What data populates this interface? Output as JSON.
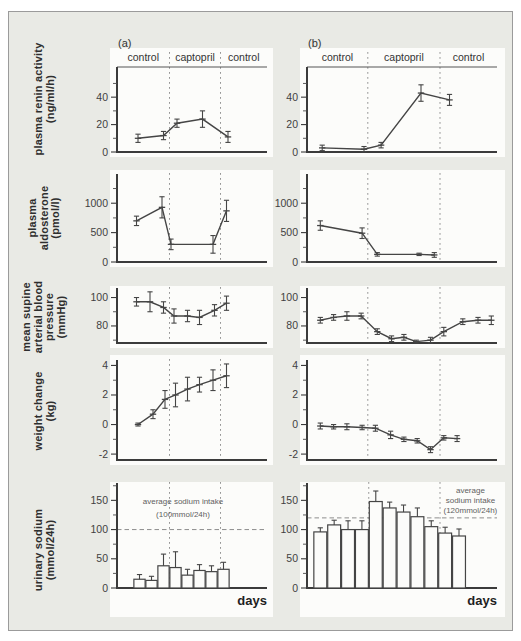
{
  "figure": {
    "period_labels": [
      "control",
      "captopril",
      "control"
    ],
    "x_axis_label": "days",
    "panel_letters": {
      "a": "(a)",
      "b": "(b)"
    },
    "colors": {
      "frame_bg": "#e9eae5",
      "plot_bg": "#fcfcfa",
      "line": "#454545",
      "dashed": "#969696",
      "text": "#333333"
    }
  },
  "rows": [
    {
      "label_lines": [
        "plasma renin activity",
        "(ng/ml/h)"
      ]
    },
    {
      "label_lines": [
        "plasma",
        "aldosterone",
        "(pmol/l)"
      ]
    },
    {
      "label_lines": [
        "mean supine",
        "arterial blood",
        "pressure",
        "(mmHg)"
      ]
    },
    {
      "label_lines": [
        "weight change",
        "(kg)"
      ]
    },
    {
      "label_lines": [
        "urinary sodium",
        "(mmol/24h)"
      ]
    }
  ],
  "chart_data": [
    {
      "id": "plasma-renin-a",
      "row": 0,
      "col": "a",
      "type": "line",
      "title": "plasma renin activity (ng/ml/h), panel (a)",
      "ylim": [
        0,
        62
      ],
      "yticks": [
        0,
        20,
        40
      ],
      "yminor": [
        10,
        30,
        50
      ],
      "dividers": [
        0.35,
        0.69
      ],
      "header": true,
      "panel_letter": "(a)",
      "x": [
        0.14,
        0.31,
        0.4,
        0.57,
        0.74
      ],
      "values": [
        10,
        12,
        21,
        24,
        11
      ],
      "errors": [
        3,
        3,
        3,
        6,
        4
      ]
    },
    {
      "id": "plasma-renin-b",
      "row": 0,
      "col": "b",
      "type": "line",
      "title": "plasma renin activity (ng/ml/h), panel (b)",
      "ylim": [
        0,
        62
      ],
      "yticks": [
        0,
        20,
        40
      ],
      "yminor": [
        10,
        30,
        50
      ],
      "dividers": [
        0.32,
        0.7
      ],
      "header": true,
      "panel_letter": "(b)",
      "x": [
        0.08,
        0.3,
        0.39,
        0.6,
        0.75
      ],
      "values": [
        3,
        2,
        5,
        43,
        38
      ],
      "errors": [
        2,
        2,
        2,
        6,
        4
      ]
    },
    {
      "id": "plasma-aldosterone-a",
      "row": 1,
      "col": "a",
      "type": "line",
      "title": "plasma aldosterone (pmol/l), panel (a)",
      "ylim": [
        0,
        1480
      ],
      "yticks": [
        0,
        500,
        1000
      ],
      "yminor": [
        250,
        750,
        1250
      ],
      "dividers": [
        0.35,
        0.69
      ],
      "x": [
        0.13,
        0.3,
        0.36,
        0.64,
        0.73
      ],
      "values": [
        700,
        930,
        300,
        300,
        870
      ],
      "errors": [
        80,
        180,
        90,
        150,
        180
      ]
    },
    {
      "id": "plasma-aldosterone-b",
      "row": 1,
      "col": "b",
      "type": "line",
      "title": "plasma aldosterone (pmol/l), panel (b)",
      "ylim": [
        0,
        1480
      ],
      "yticks": [
        0,
        500,
        1000
      ],
      "yminor": [
        250,
        750,
        1250
      ],
      "dividers": [
        0.32,
        0.7
      ],
      "x": [
        0.07,
        0.29,
        0.37,
        0.59,
        0.67
      ],
      "values": [
        620,
        490,
        130,
        130,
        120
      ],
      "errors": [
        80,
        90,
        30,
        20,
        40
      ]
    },
    {
      "id": "blood-pressure-a",
      "row": 2,
      "col": "a",
      "type": "line",
      "title": "mean supine arterial blood pressure (mmHg), panel (a)",
      "ylim": [
        68,
        106
      ],
      "yticks": [
        80,
        100
      ],
      "yminor": [
        70,
        90
      ],
      "dividers": [
        0.35,
        0.69
      ],
      "x": [
        0.13,
        0.22,
        0.31,
        0.38,
        0.47,
        0.55,
        0.65,
        0.73
      ],
      "values": [
        97,
        97,
        93,
        87,
        87,
        86,
        91,
        96
      ],
      "errors": [
        3,
        7,
        4,
        5,
        4,
        5,
        4,
        5
      ]
    },
    {
      "id": "blood-pressure-b",
      "row": 2,
      "col": "b",
      "type": "line",
      "title": "mean supine arterial blood pressure (mmHg), panel (b)",
      "ylim": [
        68,
        106
      ],
      "yticks": [
        80,
        100
      ],
      "yminor": [
        70,
        90
      ],
      "dividers": [
        0.32,
        0.7
      ],
      "x": [
        0.07,
        0.14,
        0.21,
        0.285,
        0.37,
        0.445,
        0.51,
        0.575,
        0.65,
        0.72,
        0.82,
        0.9,
        0.97
      ],
      "values": [
        84,
        86,
        87,
        87,
        76,
        71,
        72,
        69,
        70,
        76,
        83,
        84,
        84
      ],
      "errors": [
        2,
        2,
        3,
        2,
        2,
        2,
        2,
        1,
        2,
        3,
        2,
        2,
        3
      ]
    },
    {
      "id": "weight-change-a",
      "row": 3,
      "col": "a",
      "type": "line",
      "title": "weight change (kg), panel (a)",
      "ylim": [
        -2.4,
        4.3
      ],
      "yticks": [
        -2,
        0,
        2,
        4
      ],
      "yminor": [
        -1,
        1,
        3
      ],
      "dividers": [
        0.35,
        0.69
      ],
      "x": [
        0.14,
        0.24,
        0.32,
        0.39,
        0.47,
        0.55,
        0.64,
        0.73
      ],
      "values": [
        0,
        0.7,
        1.7,
        2.0,
        2.4,
        2.7,
        3.0,
        3.3
      ],
      "errors": [
        0.1,
        0.3,
        0.6,
        0.8,
        0.8,
        0.5,
        0.7,
        0.8
      ]
    },
    {
      "id": "weight-change-b",
      "row": 3,
      "col": "b",
      "type": "line",
      "title": "weight change (kg), panel (b)",
      "ylim": [
        -2.4,
        4.3
      ],
      "yticks": [
        -2,
        0,
        2,
        4
      ],
      "yminor": [
        -1,
        1,
        3
      ],
      "dividers": [
        0.32,
        0.7
      ],
      "x": [
        0.07,
        0.14,
        0.21,
        0.29,
        0.36,
        0.44,
        0.51,
        0.58,
        0.65,
        0.72,
        0.79
      ],
      "values": [
        -0.1,
        -0.15,
        -0.15,
        -0.2,
        -0.25,
        -0.7,
        -1.0,
        -1.1,
        -1.7,
        -0.9,
        -0.95
      ],
      "errors": [
        0.2,
        0.15,
        0.2,
        0.15,
        0.2,
        0.25,
        0.15,
        0.15,
        0.2,
        0.15,
        0.2
      ]
    },
    {
      "id": "urinary-sodium-a",
      "row": 4,
      "col": "a",
      "type": "bar",
      "title": "urinary sodium (mmol/24h), panel (a)",
      "ylim": [
        0,
        178
      ],
      "yticks": [
        0,
        50,
        100,
        150
      ],
      "yminor": [
        25,
        75,
        125,
        175
      ],
      "dividers": [
        0.35,
        0.69
      ],
      "bar_width": 0.075,
      "show_xlabel": true,
      "hline": 100,
      "annotation": {
        "x": 0.44,
        "v": [
          143,
          122
        ],
        "lines": [
          "average sodium intake",
          "(100mmol/24h)"
        ]
      },
      "x": [
        0.15,
        0.23,
        0.31,
        0.39,
        0.47,
        0.55,
        0.63,
        0.71
      ],
      "values": [
        15,
        13,
        38,
        35,
        22,
        30,
        28,
        32
      ],
      "errors": [
        8,
        7,
        20,
        27,
        10,
        10,
        10,
        12
      ]
    },
    {
      "id": "urinary-sodium-b",
      "row": 4,
      "col": "b",
      "type": "bar",
      "title": "urinary sodium (mmol/24h), panel (b)",
      "ylim": [
        0,
        178
      ],
      "yticks": [
        0,
        50,
        100,
        150
      ],
      "yminor": [
        25,
        75,
        125,
        175
      ],
      "dividers": [
        0.325,
        0.7
      ],
      "bar_width": 0.068,
      "show_xlabel": true,
      "hline": 120,
      "annotation": {
        "x": 0.86,
        "v": [
          163,
          146,
          129
        ],
        "lines": [
          "average",
          "sodium intake",
          "(120mmol/24h)"
        ]
      },
      "x": [
        0.07,
        0.143,
        0.216,
        0.289,
        0.362,
        0.435,
        0.508,
        0.581,
        0.654,
        0.727,
        0.8
      ],
      "values": [
        96,
        108,
        100,
        100,
        148,
        137,
        130,
        122,
        105,
        94,
        89
      ],
      "errors": [
        7,
        8,
        15,
        15,
        18,
        10,
        12,
        15,
        10,
        10,
        12
      ]
    }
  ]
}
